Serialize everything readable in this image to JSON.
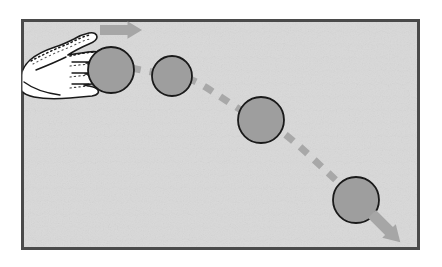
{
  "figure": {
    "title": "Hand pushing a ball along a curved trajectory",
    "panel": {
      "background_color": "#d9d9d9",
      "border_color": "#4a4a4a",
      "border_width": 3,
      "x": 21,
      "y": 19,
      "width": 399,
      "height": 231
    },
    "outer_background_color": "#ffffff",
    "colors": {
      "ball_fill": "#9e9e9e",
      "ball_stroke": "#1a1a1a",
      "arrow_gray": "#a6a6a6",
      "dash_gray": "#a8a8a8",
      "hand_fill": "#ffffff",
      "hand_stroke": "#1a1a1a",
      "panel_fill": "#d9d9d9",
      "panel_border": "#4a4a4a"
    },
    "balls": [
      {
        "label": "ball-position-1",
        "cx": 111,
        "cy": 70,
        "r": 23
      },
      {
        "label": "ball-position-2",
        "cx": 172,
        "cy": 76,
        "r": 20
      },
      {
        "label": "ball-position-3",
        "cx": 261,
        "cy": 120,
        "r": 23
      },
      {
        "label": "ball-position-4",
        "cx": 356,
        "cy": 200,
        "r": 23
      }
    ],
    "arrows": [
      {
        "label": "push-arrow",
        "direction": "right",
        "x": 100,
        "y": 30,
        "length": 42,
        "thickness": 10,
        "color": "#a6a6a6"
      },
      {
        "label": "exit-arrow",
        "direction": "down-right",
        "x": 372,
        "y": 214,
        "length": 40,
        "thickness": 11,
        "color": "#a6a6a6"
      }
    ],
    "trajectory": {
      "label": "dashed-trajectory",
      "style": "dashed",
      "color": "#a8a8a8",
      "stroke_width": 7,
      "dash_pattern": "10 9",
      "points": [
        {
          "x": 131,
          "y": 68
        },
        {
          "x": 152,
          "y": 72
        },
        {
          "x": 192,
          "y": 80
        },
        {
          "x": 241,
          "y": 110
        },
        {
          "x": 282,
          "y": 132
        },
        {
          "x": 338,
          "y": 182
        },
        {
          "x": 374,
          "y": 216
        }
      ]
    },
    "hand": {
      "label": "pushing-hand",
      "fill": "#ffffff",
      "stroke": "#1a1a1a",
      "finger_count": 4,
      "shading": "stippled-dashes"
    }
  }
}
